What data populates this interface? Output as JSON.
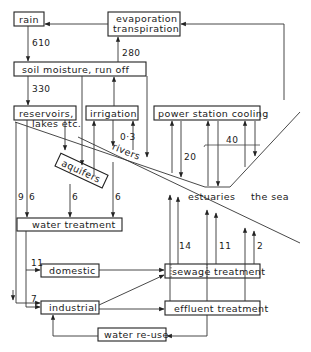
{
  "diagram": {
    "nodes": {
      "rain": "rain",
      "evap_line1": "evaporation",
      "evap_line2": "transpiration",
      "soil": "soil  moisture,  run  off",
      "reservoirs_line1": "reservoirs,",
      "reservoirs_line2": "lakes etc.",
      "irrigation": "irrigation",
      "power": "power  station  cooling",
      "aquifers": "aquifers",
      "rivers": "rivers",
      "estuaries": "estuaries",
      "sea": "the  sea",
      "water_treatment": "water  treatment",
      "domestic": "domestic",
      "industrial": "industrial",
      "sewage": "sewage  treatment",
      "effluent": "effluent  treatment",
      "reuse": "water  re-use"
    },
    "flows": {
      "rain_to_soil": "610",
      "soil_to_evap": "280",
      "soil_to_reservoirs": "330",
      "irrigation": "0·3",
      "power_return": "20",
      "power_to_sea": "40",
      "reservoirs_direct": "9",
      "reservoirs_to_treatment": "6",
      "aquifers_to_treatment": "6",
      "rivers_to_treatment": "6",
      "domestic": "11",
      "industrial": "7",
      "sewage_out1": "14",
      "sewage_out2": "11",
      "sewage_out3": "2"
    }
  }
}
